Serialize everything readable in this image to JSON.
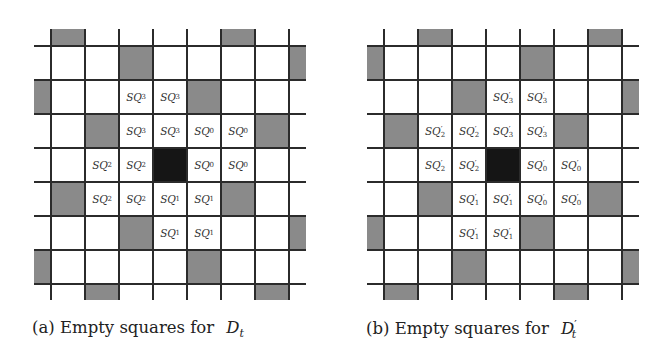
{
  "figure": {
    "grid": {
      "cell_size_px": 34,
      "line_color": "#2b2b2b",
      "grey_color": "#8a8a8a",
      "center_color": "#151515",
      "h_lines_y": [
        46,
        80,
        114,
        148,
        182,
        216,
        250,
        284
      ],
      "rows_y": [
        29,
        46,
        80,
        114,
        148,
        182,
        216,
        250,
        284
      ],
      "rows_h": [
        17,
        34,
        34,
        34,
        34,
        34,
        34,
        34,
        16
      ]
    },
    "panels": [
      {
        "id": "a",
        "offset_x": 0,
        "v_lines_x": [
          51,
          85,
          119,
          153,
          187,
          221,
          255,
          289
        ],
        "h_line_span": [
          34,
          306
        ],
        "v_line_span": [
          29,
          300
        ],
        "caption_prefix": "(a) Empty squares for",
        "caption_math": "D",
        "caption_sub": "t",
        "caption_sup": "",
        "caption_x": 32,
        "cells": [
          {
            "row": 0,
            "x": 51,
            "w": 34,
            "type": "grey"
          },
          {
            "row": 0,
            "x": 221,
            "w": 34,
            "type": "grey"
          },
          {
            "row": 1,
            "x": 119,
            "w": 34,
            "type": "grey"
          },
          {
            "row": 1,
            "x": 289,
            "w": 17,
            "type": "grey"
          },
          {
            "row": 2,
            "x": 34,
            "w": 17,
            "type": "grey"
          },
          {
            "row": 2,
            "x": 119,
            "w": 34,
            "type": "label",
            "text": "SQ",
            "sub": "3",
            "prime": false
          },
          {
            "row": 2,
            "x": 153,
            "w": 34,
            "type": "label",
            "text": "SQ",
            "sub": "3",
            "prime": false
          },
          {
            "row": 2,
            "x": 187,
            "w": 34,
            "type": "grey"
          },
          {
            "row": 3,
            "x": 85,
            "w": 34,
            "type": "grey"
          },
          {
            "row": 3,
            "x": 119,
            "w": 34,
            "type": "label",
            "text": "SQ",
            "sub": "3",
            "prime": false
          },
          {
            "row": 3,
            "x": 153,
            "w": 34,
            "type": "label",
            "text": "SQ",
            "sub": "3",
            "prime": false
          },
          {
            "row": 3,
            "x": 187,
            "w": 34,
            "type": "label",
            "text": "SQ",
            "sub": "0",
            "prime": false
          },
          {
            "row": 3,
            "x": 221,
            "w": 34,
            "type": "label",
            "text": "SQ",
            "sub": "0",
            "prime": false
          },
          {
            "row": 3,
            "x": 255,
            "w": 34,
            "type": "grey"
          },
          {
            "row": 4,
            "x": 85,
            "w": 34,
            "type": "label",
            "text": "SQ",
            "sub": "2",
            "prime": false
          },
          {
            "row": 4,
            "x": 119,
            "w": 34,
            "type": "label",
            "text": "SQ",
            "sub": "2",
            "prime": false
          },
          {
            "row": 4,
            "x": 153,
            "w": 34,
            "type": "black"
          },
          {
            "row": 4,
            "x": 187,
            "w": 34,
            "type": "label",
            "text": "SQ",
            "sub": "0",
            "prime": false
          },
          {
            "row": 4,
            "x": 221,
            "w": 34,
            "type": "label",
            "text": "SQ",
            "sub": "0",
            "prime": false
          },
          {
            "row": 5,
            "x": 51,
            "w": 34,
            "type": "grey"
          },
          {
            "row": 5,
            "x": 85,
            "w": 34,
            "type": "label",
            "text": "SQ",
            "sub": "2",
            "prime": false
          },
          {
            "row": 5,
            "x": 119,
            "w": 34,
            "type": "label",
            "text": "SQ",
            "sub": "2",
            "prime": false
          },
          {
            "row": 5,
            "x": 153,
            "w": 34,
            "type": "label",
            "text": "SQ",
            "sub": "1",
            "prime": false
          },
          {
            "row": 5,
            "x": 187,
            "w": 34,
            "type": "label",
            "text": "SQ",
            "sub": "1",
            "prime": false
          },
          {
            "row": 5,
            "x": 221,
            "w": 34,
            "type": "grey"
          },
          {
            "row": 6,
            "x": 119,
            "w": 34,
            "type": "grey"
          },
          {
            "row": 6,
            "x": 153,
            "w": 34,
            "type": "label",
            "text": "SQ",
            "sub": "1",
            "prime": false
          },
          {
            "row": 6,
            "x": 187,
            "w": 34,
            "type": "label",
            "text": "SQ",
            "sub": "1",
            "prime": false
          },
          {
            "row": 6,
            "x": 289,
            "w": 17,
            "type": "grey"
          },
          {
            "row": 7,
            "x": 34,
            "w": 17,
            "type": "grey"
          },
          {
            "row": 7,
            "x": 187,
            "w": 34,
            "type": "grey"
          },
          {
            "row": 8,
            "x": 85,
            "w": 34,
            "type": "grey"
          },
          {
            "row": 8,
            "x": 255,
            "w": 34,
            "type": "grey"
          }
        ]
      },
      {
        "id": "b",
        "offset_x": 0,
        "v_lines_x": [
          384,
          418,
          452,
          486,
          520,
          554,
          588,
          622
        ],
        "h_line_span": [
          367,
          639
        ],
        "v_line_span": [
          29,
          300
        ],
        "caption_prefix": "(b) Empty squares for",
        "caption_math": "D",
        "caption_sub": "t",
        "caption_sup": "′",
        "caption_x": 366,
        "cells": [
          {
            "row": 0,
            "x": 418,
            "w": 34,
            "type": "grey"
          },
          {
            "row": 0,
            "x": 588,
            "w": 34,
            "type": "grey"
          },
          {
            "row": 1,
            "x": 367,
            "w": 17,
            "type": "grey"
          },
          {
            "row": 1,
            "x": 520,
            "w": 34,
            "type": "grey"
          },
          {
            "row": 2,
            "x": 452,
            "w": 34,
            "type": "grey"
          },
          {
            "row": 2,
            "x": 486,
            "w": 34,
            "type": "label",
            "text": "SQ",
            "sub": "3",
            "prime": true
          },
          {
            "row": 2,
            "x": 520,
            "w": 34,
            "type": "label",
            "text": "SQ",
            "sub": "3",
            "prime": true
          },
          {
            "row": 2,
            "x": 622,
            "w": 17,
            "type": "grey"
          },
          {
            "row": 3,
            "x": 384,
            "w": 34,
            "type": "grey"
          },
          {
            "row": 3,
            "x": 418,
            "w": 34,
            "type": "label",
            "text": "SQ",
            "sub": "2",
            "prime": true
          },
          {
            "row": 3,
            "x": 452,
            "w": 34,
            "type": "label",
            "text": "SQ",
            "sub": "2",
            "prime": true
          },
          {
            "row": 3,
            "x": 486,
            "w": 34,
            "type": "label",
            "text": "SQ",
            "sub": "3",
            "prime": true
          },
          {
            "row": 3,
            "x": 520,
            "w": 34,
            "type": "label",
            "text": "SQ",
            "sub": "3",
            "prime": true
          },
          {
            "row": 3,
            "x": 554,
            "w": 34,
            "type": "grey"
          },
          {
            "row": 4,
            "x": 418,
            "w": 34,
            "type": "label",
            "text": "SQ",
            "sub": "2",
            "prime": true
          },
          {
            "row": 4,
            "x": 452,
            "w": 34,
            "type": "label",
            "text": "SQ",
            "sub": "2",
            "prime": true
          },
          {
            "row": 4,
            "x": 486,
            "w": 34,
            "type": "black"
          },
          {
            "row": 4,
            "x": 520,
            "w": 34,
            "type": "label",
            "text": "SQ",
            "sub": "0",
            "prime": true
          },
          {
            "row": 4,
            "x": 554,
            "w": 34,
            "type": "label",
            "text": "SQ",
            "sub": "0",
            "prime": true
          },
          {
            "row": 5,
            "x": 418,
            "w": 34,
            "type": "grey"
          },
          {
            "row": 5,
            "x": 452,
            "w": 34,
            "type": "label",
            "text": "SQ",
            "sub": "1",
            "prime": true
          },
          {
            "row": 5,
            "x": 486,
            "w": 34,
            "type": "label",
            "text": "SQ",
            "sub": "1",
            "prime": true
          },
          {
            "row": 5,
            "x": 520,
            "w": 34,
            "type": "label",
            "text": "SQ",
            "sub": "0",
            "prime": true
          },
          {
            "row": 5,
            "x": 554,
            "w": 34,
            "type": "label",
            "text": "SQ",
            "sub": "0",
            "prime": true
          },
          {
            "row": 5,
            "x": 588,
            "w": 34,
            "type": "grey"
          },
          {
            "row": 6,
            "x": 367,
            "w": 17,
            "type": "grey"
          },
          {
            "row": 6,
            "x": 452,
            "w": 34,
            "type": "label",
            "text": "SQ",
            "sub": "1",
            "prime": true
          },
          {
            "row": 6,
            "x": 486,
            "w": 34,
            "type": "label",
            "text": "SQ",
            "sub": "1",
            "prime": true
          },
          {
            "row": 6,
            "x": 520,
            "w": 34,
            "type": "grey"
          },
          {
            "row": 7,
            "x": 452,
            "w": 34,
            "type": "grey"
          },
          {
            "row": 7,
            "x": 622,
            "w": 17,
            "type": "grey"
          },
          {
            "row": 8,
            "x": 384,
            "w": 34,
            "type": "grey"
          },
          {
            "row": 8,
            "x": 554,
            "w": 34,
            "type": "grey"
          }
        ]
      }
    ]
  }
}
